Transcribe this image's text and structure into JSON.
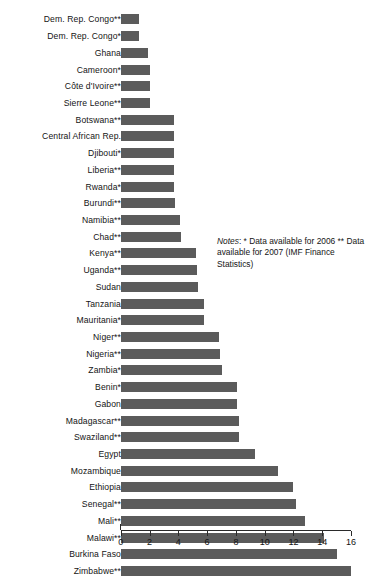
{
  "chart_data": {
    "type": "bar",
    "orientation": "horizontal",
    "title": "",
    "subtitle": "",
    "xlabel": "",
    "ylabel": "",
    "xlim": [
      0,
      16
    ],
    "xticks": [
      0,
      2,
      4,
      6,
      8,
      10,
      12,
      14,
      16
    ],
    "xtick_labels": [
      "0",
      "2",
      "4",
      "6",
      "8",
      "10",
      "12",
      "14",
      "16"
    ],
    "grid": false,
    "legend": null,
    "bar_color": "#5b5b5b",
    "categories": [
      "Dem. Rep. Congo**",
      "Dem. Rep. Congo*",
      "Ghana",
      "Cameroon*",
      "Côte d'Ivoire**",
      "Sierre Leone**",
      "Botswana**",
      "Central African Rep.",
      "Djibouti*",
      "Liberia**",
      "Rwanda*",
      "Burundi**",
      "Namibia**",
      "Chad**",
      "Kenya**",
      "Uganda**",
      "Sudan",
      "Tanzania",
      "Mauritania*",
      "Niger**",
      "Nigeria**",
      "Zambia*",
      "Benin*",
      "Gabon",
      "Madagascar**",
      "Swaziland**",
      "Egypt",
      "Mozambique",
      "Ethiopia",
      "Senegal**",
      "Mali**",
      "Malawi**",
      "Burkina Faso",
      "Zimbabwe**"
    ],
    "values": [
      1.3,
      1.3,
      1.9,
      2.0,
      2.0,
      2.0,
      3.7,
      3.7,
      3.7,
      3.7,
      3.7,
      3.8,
      4.1,
      4.2,
      5.2,
      5.3,
      5.4,
      5.8,
      5.8,
      6.8,
      6.9,
      7.0,
      8.1,
      8.1,
      8.2,
      8.2,
      9.3,
      10.9,
      12.0,
      12.2,
      12.8,
      14.1,
      15.0,
      16.0
    ],
    "notes": {
      "label": "Notes",
      "text": ": * Data available for 2006 ** Data available for 2007 (IMF Finance Statistics)"
    }
  }
}
